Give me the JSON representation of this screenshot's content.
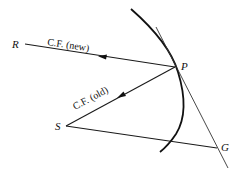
{
  "diagram": {
    "points": {
      "P": {
        "label": "P",
        "x": 175,
        "y": 67
      },
      "R": {
        "label": "R",
        "x": 24,
        "y": 44
      },
      "S": {
        "label": "S",
        "x": 64,
        "y": 126
      },
      "G": {
        "label": "G",
        "x": 217,
        "y": 148
      }
    },
    "labels": {
      "cf_new": "C.F. (new)",
      "cf_old": "C.F. (old)"
    },
    "edges": [
      {
        "from": "P",
        "to": "R",
        "label": "C.F. (new)",
        "arrow": true
      },
      {
        "from": "P",
        "to": "S",
        "label": "C.F. (old)",
        "arrow": true
      },
      {
        "from": "S",
        "to": "G",
        "arrow": false
      },
      {
        "name": "tangent",
        "through": [
          "P",
          "G"
        ],
        "arrow": false
      }
    ],
    "curve": "orbit arc through P"
  }
}
